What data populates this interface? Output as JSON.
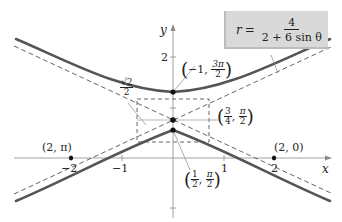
{
  "equation": {
    "lhs": "r",
    "equals": "=",
    "numerator": "4",
    "denominator": "2 + 6 sin θ"
  },
  "axes": {
    "x_label": "x",
    "y_label": "y",
    "x_ticks": [
      "−2",
      "−1",
      "1",
      "2"
    ],
    "y_ticks": [
      "2",
      "1"
    ]
  },
  "points": {
    "top_vertex": {
      "open": "(",
      "a": "−1,",
      "num": "3π",
      "den": "2",
      "close": ")"
    },
    "center": {
      "open": "(",
      "num1": "3",
      "den1": "4",
      "comma": ",",
      "num2": "π",
      "den2": "2",
      "close": ")"
    },
    "bottom_vertex": {
      "open": "(",
      "num1": "1",
      "den1": "2",
      "comma": ",",
      "num2": "π",
      "den2": "2",
      "close": ")"
    },
    "left_x_intercept": "(2, π)",
    "right_x_intercept": "(2, 0)",
    "half_width": {
      "num": "√2",
      "den": "2"
    }
  },
  "colors": {
    "curve": "#555555",
    "dashed": "#555555",
    "axis": "#888888",
    "eq_box": "#d9d9d9"
  }
}
